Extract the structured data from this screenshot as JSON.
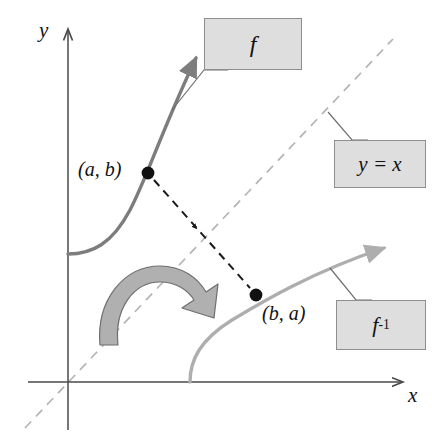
{
  "figure": {
    "type": "function-inverse-reflection-diagram",
    "axes": {
      "x_label": "x",
      "y_label": "y",
      "origin": [
        68,
        382
      ]
    },
    "points": [
      {
        "name": "point-ab",
        "label": "(a, b)",
        "x": 148,
        "y": 173,
        "on_curve": "f"
      },
      {
        "name": "point-ba",
        "label": "(b, a)",
        "x": 256,
        "y": 295,
        "on_curve": "f-inverse"
      }
    ],
    "callouts": [
      {
        "name": "callout-f",
        "label": "f",
        "target_curve": "f"
      },
      {
        "name": "callout-yx",
        "label": "y = x",
        "target_curve": "identity-line"
      },
      {
        "name": "callout-finv",
        "label_base": "f",
        "label_exponent": "-1",
        "target_curve": "f-inverse"
      }
    ],
    "curves": [
      {
        "name": "f",
        "color": "#7d7d7d",
        "style": "solid",
        "arrow": "end"
      },
      {
        "name": "f-inverse",
        "color": "#aeaeae",
        "style": "solid",
        "arrow": "end"
      },
      {
        "name": "identity-line",
        "color": "#b4b4b4",
        "style": "dashed",
        "arrow": "none"
      },
      {
        "name": "reflection-connector",
        "color": "#1a1a1a",
        "style": "dashed",
        "arrow": "mid"
      }
    ],
    "rotation_arrow": {
      "name": "reflection-rotation-arrow",
      "fill": "#b0b0b0",
      "stroke": "#6e6e6e"
    },
    "colors": {
      "background": "#ffffff",
      "axis": "#4a4a4a",
      "curve_f": "#7d7d7d",
      "curve_f_inverse": "#aeaeae",
      "identity_line": "#b4b4b4",
      "connector": "#1a1a1a",
      "callout_fill": "#dedede",
      "callout_border": "#8e8e8e",
      "text": "#111111"
    }
  }
}
